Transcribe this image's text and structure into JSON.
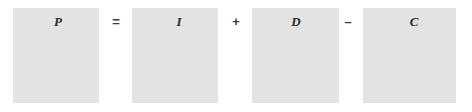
{
  "figure": {
    "kind": "equation-diagram",
    "background_color": "#ffffff",
    "box_fill_color": "#e3e3e3",
    "label_color": "#2b2b2b",
    "operator_color": "#3a3a3a"
  },
  "terms": [
    {
      "label": "P",
      "box": {
        "x": 13,
        "y": 8,
        "width": 86,
        "height": 95
      },
      "label_pos": {
        "x": 58,
        "y": 15
      }
    },
    {
      "label": "I",
      "box": {
        "x": 132,
        "y": 8,
        "width": 86,
        "height": 95
      },
      "label_pos": {
        "x": 179,
        "y": 15
      }
    },
    {
      "label": "D",
      "box": {
        "x": 252,
        "y": 8,
        "width": 87,
        "height": 95
      },
      "label_pos": {
        "x": 296,
        "y": 15
      }
    },
    {
      "label": "C",
      "box": {
        "x": 363,
        "y": 8,
        "width": 93,
        "height": 95
      },
      "label_pos": {
        "x": 414,
        "y": 15
      }
    }
  ],
  "operators": [
    {
      "symbol": "=",
      "name": "equals",
      "x": 116,
      "y": 15
    },
    {
      "symbol": "+",
      "name": "plus",
      "x": 236,
      "y": 15
    },
    {
      "symbol": "–",
      "name": "minus",
      "x": 348,
      "y": 15
    }
  ]
}
